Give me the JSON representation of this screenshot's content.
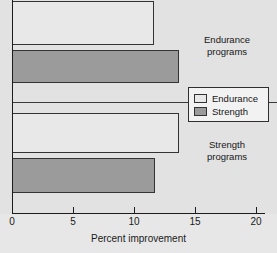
{
  "chart_data": {
    "type": "bar",
    "orientation": "horizontal",
    "title": "",
    "xlabel": "Percent improvement",
    "ylabel": "",
    "xlim": [
      0,
      20
    ],
    "xticks": [
      0,
      5,
      10,
      15,
      20
    ],
    "xtick_labels": [
      "0",
      "5",
      "10",
      "15",
      "20"
    ],
    "grid": false,
    "categories": [
      "Endurance programs",
      "Strength programs"
    ],
    "series": [
      {
        "name": "Endurance",
        "color": "#e8e8e8",
        "values": [
          11.6,
          13.7
        ]
      },
      {
        "name": "Strength",
        "color": "#9b9b9b",
        "values": [
          13.7,
          11.7
        ]
      }
    ],
    "bars": [
      {
        "group": "Endurance programs",
        "series": "Endurance",
        "value": 11.6
      },
      {
        "group": "Endurance programs",
        "series": "Strength",
        "value": 13.7
      },
      {
        "group": "Strength programs",
        "series": "Endurance",
        "value": 13.7
      },
      {
        "group": "Strength programs",
        "series": "Strength",
        "value": 11.7
      }
    ],
    "legend": {
      "position": "center-right",
      "entries": [
        {
          "label": "Endurance",
          "color": "#e8e8e8"
        },
        {
          "label": "Strength",
          "color": "#9b9b9b"
        }
      ]
    },
    "group_labels": [
      {
        "line1": "Endurance",
        "line2": "programs"
      },
      {
        "line1": "Strength",
        "line2": "programs"
      }
    ],
    "colors": {
      "panel_background": "#e2e2e2",
      "axis": "#1c1c1c",
      "endurance_fill": "#e8e8e8",
      "strength_fill": "#9b9b9b",
      "bar_outline": "#333333",
      "text": "#161616"
    }
  }
}
